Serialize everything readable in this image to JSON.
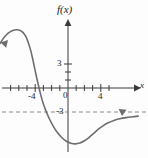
{
  "chart_data": {
    "type": "line",
    "title": "",
    "xlabel": "x",
    "ylabel": "f(x)",
    "xlim": [
      -8.5,
      9.0
    ],
    "ylim": [
      -8.0,
      9.5
    ],
    "grid": false,
    "legend": null,
    "x_ticks": [
      -7,
      -6,
      -5,
      -4,
      -3,
      -2,
      -1,
      1,
      2,
      3,
      4,
      5
    ],
    "x_tick_labels": [
      {
        "value": -4,
        "label": "-4"
      },
      {
        "value": 0,
        "label": "0"
      },
      {
        "value": 4,
        "label": "4"
      }
    ],
    "y_ticks": [
      1,
      2,
      3
    ],
    "y_tick_labels": [
      {
        "value": 3,
        "label": "3"
      },
      {
        "value": -3,
        "label": "-3"
      }
    ],
    "annotations": [
      {
        "name": "horizontal-asymptote",
        "kind": "dashed-line",
        "orientation": "horizontal",
        "value": -3,
        "label": "-3",
        "style": "dashed",
        "color": "#8a8a8a"
      },
      {
        "name": "left-arrowhead",
        "kind": "arrowhead",
        "x": -8.2,
        "y": 5.6
      },
      {
        "name": "right-arrowhead",
        "kind": "arrowhead",
        "x": 8.6,
        "y": -3.5
      }
    ],
    "series": [
      {
        "name": "f(x)",
        "color": "#6e6e6e",
        "width": 1.6,
        "points": [
          {
            "x": -8.3,
            "y": 5.55
          },
          {
            "x": -7.8,
            "y": 6.3
          },
          {
            "x": -7.3,
            "y": 6.85
          },
          {
            "x": -6.8,
            "y": 7.15
          },
          {
            "x": -6.3,
            "y": 7.28
          },
          {
            "x": -5.9,
            "y": 7.22
          },
          {
            "x": -5.5,
            "y": 6.95
          },
          {
            "x": -5.15,
            "y": 6.45
          },
          {
            "x": -4.85,
            "y": 5.7
          },
          {
            "x": -4.55,
            "y": 4.7
          },
          {
            "x": -4.3,
            "y": 3.6
          },
          {
            "x": -4.05,
            "y": 2.4
          },
          {
            "x": -3.8,
            "y": 1.2
          },
          {
            "x": -3.55,
            "y": 0.1
          },
          {
            "x": -3.3,
            "y": -0.95
          },
          {
            "x": -3.0,
            "y": -2.0
          },
          {
            "x": -2.6,
            "y": -3.1
          },
          {
            "x": -2.2,
            "y": -4.0
          },
          {
            "x": -1.7,
            "y": -4.95
          },
          {
            "x": -1.2,
            "y": -5.7
          },
          {
            "x": -0.7,
            "y": -6.25
          },
          {
            "x": -0.2,
            "y": -6.65
          },
          {
            "x": 0.35,
            "y": -6.9
          },
          {
            "x": 0.9,
            "y": -6.98
          },
          {
            "x": 1.45,
            "y": -6.88
          },
          {
            "x": 2.0,
            "y": -6.6
          },
          {
            "x": 2.55,
            "y": -6.2
          },
          {
            "x": 3.1,
            "y": -5.7
          },
          {
            "x": 3.7,
            "y": -5.15
          },
          {
            "x": 4.3,
            "y": -4.7
          },
          {
            "x": 4.9,
            "y": -4.35
          },
          {
            "x": 5.6,
            "y": -4.05
          },
          {
            "x": 6.3,
            "y": -3.85
          },
          {
            "x": 7.1,
            "y": -3.7
          },
          {
            "x": 7.9,
            "y": -3.6
          },
          {
            "x": 8.55,
            "y": -3.52
          }
        ]
      }
    ],
    "features": {
      "local_maximum": {
        "x": -6.3,
        "y": 7.3
      },
      "local_minimum": {
        "x": 0.9,
        "y": -7.0
      },
      "x_intercept": -3.55,
      "horizontal_asymptote": -3
    }
  },
  "labels": {
    "y_axis_function": "f(x)",
    "x_axis_variable": "x",
    "x_tick_minus4": "-4",
    "x_tick_zero": "0",
    "x_tick_four": "4",
    "y_tick_three": "3",
    "y_tick_minus_three": "-3"
  },
  "colors": {
    "curve": "#6e6e6e",
    "axis": "#3a3a3a",
    "asymptote": "#8a8a8a",
    "text": "#1a1a1a",
    "background": "#fdfdfd"
  }
}
